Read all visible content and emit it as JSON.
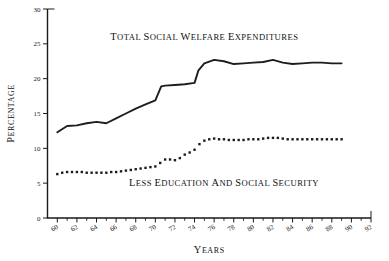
{
  "chart_data": {
    "type": "line",
    "title": "",
    "xlabel": "Years",
    "ylabel": "Percentage",
    "xlim": [
      59,
      92
    ],
    "ylim": [
      0,
      30
    ],
    "grid": false,
    "legend_position": "inline-annotations",
    "y_ticks": [
      0,
      5,
      10,
      15,
      20,
      25,
      30
    ],
    "y_tick_labels": [
      "0",
      "5",
      "10",
      "15",
      "20",
      "25",
      "30"
    ],
    "x_ticks": [
      60,
      62,
      64,
      66,
      68,
      70,
      72,
      74,
      76,
      78,
      80,
      82,
      84,
      86,
      88,
      90,
      92
    ],
    "x_tick_labels": [
      "60",
      "62",
      "64",
      "66",
      "68",
      "70",
      "72",
      "74",
      "76",
      "78",
      "80",
      "82",
      "84",
      "86",
      "88",
      "90",
      "92"
    ],
    "x_minor_ticks": [
      61,
      63,
      65,
      67,
      69,
      71,
      73,
      75,
      77,
      79,
      81,
      83,
      85,
      87,
      89,
      91
    ],
    "annotations": [
      {
        "text": "Total Social Welfare Expenditures",
        "x": 75,
        "y": 25.6
      },
      {
        "text": "Less Education and Social Security",
        "x": 77,
        "y": 4.6
      }
    ],
    "series": [
      {
        "name": "Total Social Welfare Expenditures",
        "style": "solid",
        "color": "#1d1d1d",
        "x": [
          60,
          61,
          62,
          63,
          64,
          65,
          66,
          67,
          68,
          69,
          70,
          70.6,
          71,
          72,
          73,
          74,
          74.4,
          75,
          76,
          77,
          78,
          79,
          80,
          81,
          82,
          83,
          84,
          85,
          86,
          87,
          88,
          89
        ],
        "values": [
          12.3,
          13.2,
          13.3,
          13.6,
          13.8,
          13.6,
          14.3,
          15.0,
          15.7,
          16.3,
          16.9,
          18.9,
          19.0,
          19.1,
          19.2,
          19.4,
          21.2,
          22.2,
          22.7,
          22.5,
          22.1,
          22.2,
          22.3,
          22.4,
          22.7,
          22.3,
          22.1,
          22.2,
          22.3,
          22.3,
          22.2,
          22.2
        ]
      },
      {
        "name": "Less Education and Social Security",
        "style": "dotted",
        "color": "#1d1d1d",
        "x": [
          60,
          60.5,
          61,
          61.5,
          62,
          62.5,
          63,
          63.5,
          64,
          64.5,
          65,
          65.5,
          66,
          66.5,
          67,
          67.5,
          68,
          68.5,
          69,
          69.5,
          70,
          70.5,
          71,
          71.5,
          72,
          72.5,
          73,
          73.5,
          74,
          74.5,
          75,
          75.5,
          76,
          76.5,
          77,
          77.5,
          78,
          78.5,
          79,
          79.5,
          80,
          80.5,
          81,
          81.5,
          82,
          82.5,
          83,
          83.5,
          84,
          84.5,
          85,
          85.5,
          86,
          86.5,
          87,
          87.5,
          88,
          88.5,
          89
        ],
        "values": [
          6.3,
          6.5,
          6.6,
          6.6,
          6.6,
          6.6,
          6.5,
          6.5,
          6.5,
          6.5,
          6.5,
          6.6,
          6.6,
          6.7,
          6.8,
          6.9,
          7.0,
          7.1,
          7.2,
          7.3,
          7.4,
          7.9,
          8.4,
          8.4,
          8.3,
          8.6,
          9.1,
          9.4,
          9.8,
          10.6,
          11.1,
          11.3,
          11.4,
          11.3,
          11.3,
          11.2,
          11.2,
          11.2,
          11.2,
          11.3,
          11.3,
          11.3,
          11.4,
          11.5,
          11.5,
          11.5,
          11.4,
          11.3,
          11.3,
          11.3,
          11.3,
          11.3,
          11.3,
          11.3,
          11.3,
          11.3,
          11.3,
          11.3,
          11.3
        ]
      }
    ]
  }
}
